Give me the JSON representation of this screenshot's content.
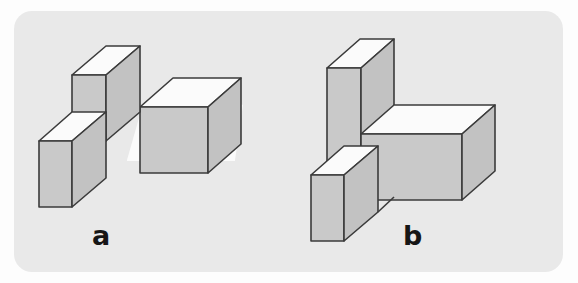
{
  "figure": {
    "kind": "mental-rotation-block-pair",
    "panel": {
      "background_color": "#e9e9e9",
      "page_background_color": "#fdfdfd",
      "corner_radius_px": 18
    },
    "style": {
      "stroke_color": "#3b3b3b",
      "stroke_width": 1.6,
      "top_face_color": "#fbfbfb",
      "front_face_color": "#c9c9c9",
      "side_face_color": "#c2c2c2",
      "label_color": "#161616"
    },
    "background_bleed_text": {
      "line_1": "for a cube",
      "line_2": "2b) 3 to 4",
      "line_3": "6 given"
    },
    "items": [
      {
        "id": "a",
        "label": "a",
        "description": "Three-cube L assembly: one cube stacked above-left, one cube at lower left, and a two-unit horizontal bar extending to the right.",
        "parts": [
          {
            "name": "upper-left-cube",
            "units": [
              1,
              1,
              1
            ]
          },
          {
            "name": "lower-left-cube",
            "units": [
              1,
              1,
              1
            ]
          },
          {
            "name": "right-horizontal-bar",
            "units": [
              2,
              1,
              1
            ]
          }
        ],
        "cube_count": 4
      },
      {
        "id": "b",
        "label": "b",
        "description": "Tall two-unit vertical column with a two-unit horizontal bar extending right from its middle and a single cube attached at the lower left.",
        "parts": [
          {
            "name": "vertical-column",
            "units": [
              1,
              2,
              1
            ]
          },
          {
            "name": "right-horizontal-bar",
            "units": [
              2,
              1,
              1
            ]
          },
          {
            "name": "lower-left-cube",
            "units": [
              1,
              1,
              1
            ]
          }
        ],
        "cube_count": 5
      }
    ]
  }
}
